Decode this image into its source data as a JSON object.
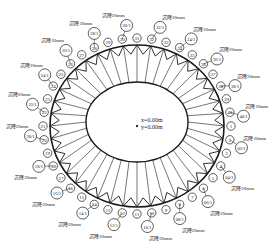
{
  "diagram": {
    "center_label": {
      "x_text": "x=0.00m",
      "y_text": "y=0.00m"
    },
    "colors": {
      "stroke": "#1a1a1a",
      "text": "#222222",
      "background": "#ffffff"
    },
    "geometry": {
      "cx": 137,
      "cy": 126,
      "outer_rx": 87,
      "outer_ry": 81,
      "inner_cx": 137,
      "inner_cy": 122,
      "inner_rx": 51,
      "inner_ry": 40,
      "node_count": 40
    },
    "nodes": [
      "1",
      "2",
      "3",
      "4",
      "5",
      "6",
      "7",
      "8",
      "9",
      "10",
      "11",
      "12",
      "13",
      "14",
      "15",
      "16",
      "17",
      "18",
      "19",
      "20",
      "21",
      "22",
      "23",
      "24",
      "25",
      "26",
      "27",
      "28",
      "29",
      "30",
      "31",
      "32",
      "33",
      "34",
      "35",
      "36",
      "37",
      "38",
      "39",
      "40"
    ],
    "settlement_labels": [
      {
        "node": 2,
        "id": "02/1",
        "value": "沉降20mm"
      },
      {
        "node": 4,
        "id": "04/1",
        "value": "沉降20mm"
      },
      {
        "node": 6,
        "id": "06/1",
        "value": "沉降20mm"
      },
      {
        "node": 8,
        "id": "08/1",
        "value": "沉降20mm"
      },
      {
        "node": 10,
        "id": "10/1",
        "value": "沉降20mm"
      },
      {
        "node": 12,
        "id": "12/1",
        "value": "沉降20mm"
      },
      {
        "node": 14,
        "id": "14/1",
        "value": "沉降20mm"
      },
      {
        "node": 16,
        "id": "16/1",
        "value": "沉降20mm"
      },
      {
        "node": 18,
        "id": "18/1",
        "value": "沉降20mm"
      },
      {
        "node": 20,
        "id": "20/1",
        "value": "沉降20mm"
      },
      {
        "node": 22,
        "id": "22/1",
        "value": "沉降20mm"
      },
      {
        "node": 24,
        "id": "24/1",
        "value": "沉降20mm"
      },
      {
        "node": 26,
        "id": "26/1",
        "value": "沉降20mm"
      },
      {
        "node": 28,
        "id": "28/1",
        "value": "沉降20mm"
      },
      {
        "node": 30,
        "id": "30/1",
        "value": "沉降20mm"
      },
      {
        "node": 32,
        "id": "32/1",
        "value": "沉降20mm"
      },
      {
        "node": 34,
        "id": "34/1",
        "value": "沉降20mm"
      },
      {
        "node": 36,
        "id": "36/1",
        "value": "沉降20mm"
      },
      {
        "node": 38,
        "id": "38/1",
        "value": "沉降20mm"
      },
      {
        "node": 40,
        "id": "40/1",
        "value": "沉降20mm"
      }
    ]
  }
}
